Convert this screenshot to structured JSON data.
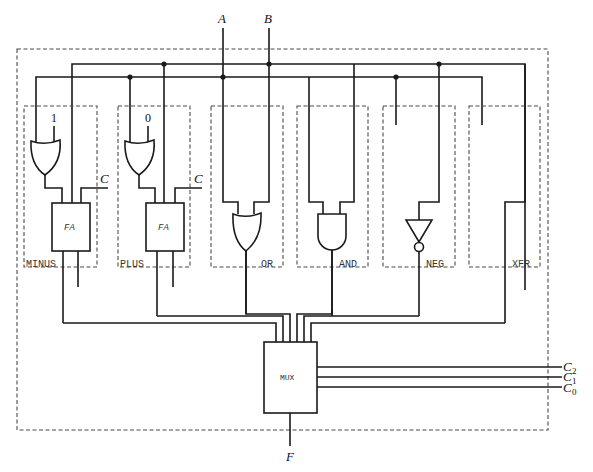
{
  "diagram": {
    "type": "logic circuit",
    "inputs": {
      "a": "A",
      "b": "B"
    },
    "output": "F",
    "modules": [
      {
        "id": "minus",
        "label": "MINUS",
        "gate": "OR",
        "const_input": "1",
        "carry_label": "C",
        "adder_label": "FA"
      },
      {
        "id": "plus",
        "label": "PLUS",
        "gate": "OR",
        "const_input": "0",
        "carry_label": "C",
        "adder_label": "FA"
      },
      {
        "id": "or",
        "label": "OR",
        "gate": "OR"
      },
      {
        "id": "and",
        "label": "AND",
        "gate": "AND"
      },
      {
        "id": "neg",
        "label": "NEG",
        "gate": "NOT"
      },
      {
        "id": "xfr",
        "label": "XFR",
        "gate": "wire"
      }
    ],
    "mux": {
      "label": "MUX"
    },
    "controls": [
      {
        "name": "C",
        "sub": "2"
      },
      {
        "name": "C",
        "sub": "1"
      },
      {
        "name": "C",
        "sub": "0"
      }
    ],
    "colors": {
      "line": "#1a1a1a",
      "dashed": "#4a4a4a",
      "background": "#ffffff"
    }
  }
}
